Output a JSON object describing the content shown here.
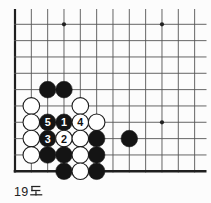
{
  "caption": "19도",
  "colors": {
    "background": "#fcfcfc",
    "grid_line": "#555555",
    "board_edge": "#1f1f1f",
    "star_point": "#222222",
    "black_stone": "#141414",
    "white_stone": "#ffffff",
    "stone_outline": "#1c1c1c",
    "number_on_black": "#ffffff",
    "number_on_white": "#111111",
    "caption_text": "#222222"
  },
  "board": {
    "grid": {
      "cols": 12,
      "rows": 10,
      "spacing": 16.33,
      "origin_x": 15,
      "origin_y": 24.3,
      "top_overhang_y": 9,
      "left_extent_x": 14,
      "right_extent_x": 206.5,
      "stone_radius": 8.3,
      "star_radius": 2.1
    },
    "edges": {
      "left_thick": true,
      "bottom_thick": true
    },
    "star_points": [
      {
        "col": 4,
        "row": 1
      },
      {
        "col": 10,
        "row": 1
      },
      {
        "col": 10,
        "row": 7
      }
    ],
    "stones": [
      {
        "col": 3,
        "row": 5,
        "color": "black"
      },
      {
        "col": 4,
        "row": 5,
        "color": "black"
      },
      {
        "col": 2,
        "row": 6,
        "color": "white"
      },
      {
        "col": 5,
        "row": 6,
        "color": "white"
      },
      {
        "col": 2,
        "row": 7,
        "color": "white"
      },
      {
        "col": 3,
        "row": 7,
        "color": "black",
        "label": "5"
      },
      {
        "col": 4,
        "row": 7,
        "color": "black",
        "label": "1"
      },
      {
        "col": 5,
        "row": 7,
        "color": "white",
        "label": "4"
      },
      {
        "col": 6,
        "row": 7,
        "color": "white"
      },
      {
        "col": 2,
        "row": 8,
        "color": "white"
      },
      {
        "col": 3,
        "row": 8,
        "color": "black",
        "label": "3"
      },
      {
        "col": 4,
        "row": 8,
        "color": "white",
        "label": "2"
      },
      {
        "col": 5,
        "row": 8,
        "color": "white"
      },
      {
        "col": 6,
        "row": 8,
        "color": "black"
      },
      {
        "col": 8,
        "row": 8,
        "color": "black"
      },
      {
        "col": 2,
        "row": 9,
        "color": "white"
      },
      {
        "col": 3,
        "row": 9,
        "color": "black"
      },
      {
        "col": 4,
        "row": 9,
        "color": "black"
      },
      {
        "col": 5,
        "row": 9,
        "color": "white"
      },
      {
        "col": 6,
        "row": 9,
        "color": "black"
      },
      {
        "col": 4,
        "row": 10,
        "color": "black"
      },
      {
        "col": 5,
        "row": 10,
        "color": "white"
      },
      {
        "col": 6,
        "row": 10,
        "color": "black"
      }
    ]
  }
}
